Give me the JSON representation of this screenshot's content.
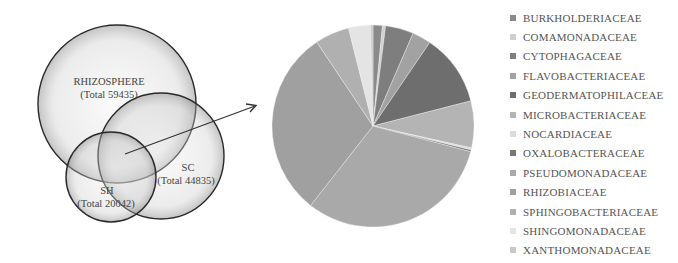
{
  "venn": {
    "sets": [
      {
        "name": "RHIZOSPHERE",
        "total_label": "(Total 59435)",
        "total": 59435
      },
      {
        "name": "SC",
        "total_label": "(Total 44835)",
        "total": 44835
      },
      {
        "name": "SH",
        "total_label": "(Total 20042)",
        "total": 20042
      }
    ]
  },
  "chart_data": {
    "type": "pie",
    "title": "",
    "legend_position": "right",
    "categories": [
      "BURKHOLDERIACEAE",
      "COMAMONADACEAE",
      "CYTOPHAGACEAE",
      "FLAVOBACTERIACEAE",
      "GEODERMATOPHILACEAE",
      "MICROBACTERIACEAE",
      "NOCARDIACEAE",
      "OXALOBACTERACEAE",
      "PSEUDOMONADACEAE",
      "RHIZOBIACEAE",
      "SPHINGOBACTERIACEAE",
      "SHINGOMONADACEAE",
      "XANTHOMONADACEAE"
    ],
    "values": [
      1.5,
      0.5,
      4.5,
      3.0,
      11.5,
      7.5,
      0.3,
      0.3,
      31.5,
      30.0,
      5.5,
      3.5,
      0.4
    ],
    "colors": [
      "#8a8a8a",
      "#d0d0d0",
      "#7e7e7e",
      "#a2a2a2",
      "#6e6e6e",
      "#b4b4b4",
      "#dcdcdc",
      "#777777",
      "#a9a9a9",
      "#a0a0a0",
      "#b0b0b0",
      "#e4e4e4",
      "#c8c8c8"
    ],
    "unit": "percent (estimated)"
  }
}
